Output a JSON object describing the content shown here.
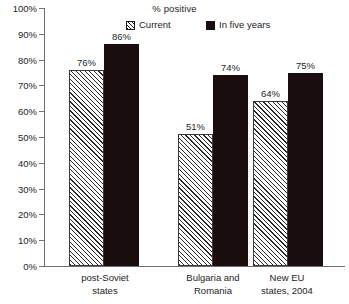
{
  "chart_data": {
    "type": "bar",
    "title": "% positive",
    "xlabel": "",
    "ylabel": "",
    "ylim": [
      0,
      100
    ],
    "ytick_labels": [
      "100%",
      "90%",
      "80%",
      "70%",
      "60%",
      "50%",
      "40%",
      "30%",
      "20%",
      "10%",
      "0%"
    ],
    "ytick_values": [
      100,
      90,
      80,
      70,
      60,
      50,
      40,
      30,
      20,
      10,
      0
    ],
    "grid": false,
    "legend_position": "top",
    "categories": [
      {
        "lines": [
          "post-Soviet",
          "states"
        ],
        "text": "post-Soviet states"
      },
      {
        "lines": [
          "Bulgaria and",
          "Romania"
        ],
        "text": "Bulgaria and Romania"
      },
      {
        "lines": [
          "New EU",
          "states, 2004"
        ],
        "text": "New EU states, 2004"
      }
    ],
    "series": [
      {
        "name": "Current",
        "style": "hatched",
        "color": "#f6f6f6",
        "values": [
          76,
          51,
          64
        ],
        "labels": [
          "76%",
          "51%",
          "64%"
        ]
      },
      {
        "name": "In five years",
        "style": "solid",
        "color": "#1a0d0d",
        "values": [
          86,
          74,
          75
        ],
        "labels": [
          "86%",
          "74%",
          "75%"
        ]
      }
    ]
  },
  "legend": {
    "entries": [
      {
        "label": "Current",
        "swatch": "hatched-swatch-icon"
      },
      {
        "label": "In five years",
        "swatch": "solid-swatch-icon"
      }
    ]
  }
}
